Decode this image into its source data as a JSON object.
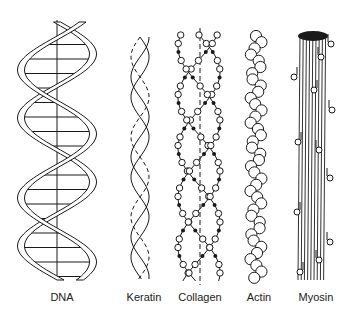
{
  "figure": {
    "labels": [
      "DNA",
      "Keratin",
      "Collagen",
      "Actin",
      "Myosin"
    ],
    "colors": {
      "line": "#1a1a1a",
      "fill": "#ffffff",
      "background": "#ffffff"
    }
  }
}
